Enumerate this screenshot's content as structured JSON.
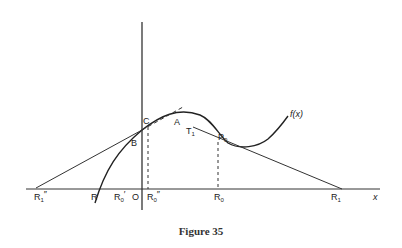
{
  "figure": {
    "caption": "Figure 35",
    "function_label": "f(x)",
    "axis_label_x": "x",
    "points": {
      "C": "C",
      "A": "A",
      "B": "B",
      "T1": "T",
      "T1_sub": "1",
      "P0": "P",
      "P0_sub": "0",
      "O": "O",
      "R": "R",
      "R0prime": "R",
      "R0prime_sub": "0",
      "R0prime_mark": "′",
      "R0dprime": "R",
      "R0dprime_sub": "0",
      "R0dprime_mark": "″",
      "R1dprime": "R",
      "R1dprime_sub": "1",
      "R1dprime_mark": "″",
      "R0": "R",
      "R0_sub": "0",
      "R1": "R",
      "R1_sub": "1"
    }
  }
}
